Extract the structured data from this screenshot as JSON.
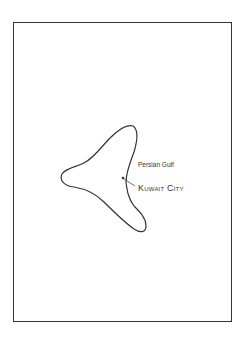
{
  "map": {
    "labels": {
      "water_body": "Persian Gulf",
      "city": "Kuwait City"
    },
    "colors": {
      "outline": "#333333",
      "background": "#ffffff"
    }
  }
}
